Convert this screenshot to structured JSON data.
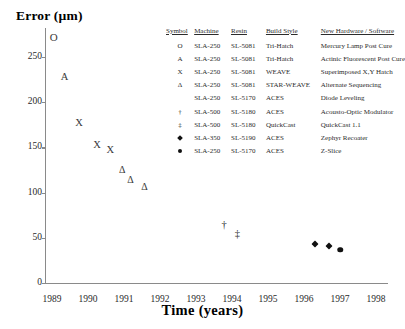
{
  "chart": {
    "type": "scatter",
    "y_axis_title": "Error (µm)",
    "x_axis_title": "Time (years)"
  },
  "chart_data": {
    "type": "scatter",
    "title": "",
    "xlabel": "Time (years)",
    "ylabel": "Error (µm)",
    "xlim": [
      1988.6,
      1998.5
    ],
    "ylim": [
      0,
      280
    ],
    "grid": false,
    "legend_position": "upper-right-inside",
    "y_ticks": [
      0,
      50,
      100,
      150,
      200,
      250
    ],
    "x_ticks": [
      1989,
      1990,
      1991,
      1992,
      1993,
      1994,
      1995,
      1996,
      1997,
      1998
    ],
    "series": [
      {
        "name": "Tri-Hatch / Mercury Lamp Post Cure",
        "marker": "O",
        "points": [
          {
            "x": 1989.05,
            "y": 272
          }
        ]
      },
      {
        "name": "Tri-Hatch / Actinic Fluorescent Post Cure",
        "marker": "A",
        "points": [
          {
            "x": 1989.35,
            "y": 228
          }
        ]
      },
      {
        "name": "WEAVE / Superimposed X,Y Hatch",
        "marker": "X",
        "points": [
          {
            "x": 1989.75,
            "y": 177
          },
          {
            "x": 1990.25,
            "y": 153
          },
          {
            "x": 1990.62,
            "y": 147
          }
        ]
      },
      {
        "name": "STAR-WEAVE / Alternate Sequencing",
        "marker": "Δ",
        "points": [
          {
            "x": 1990.95,
            "y": 125
          },
          {
            "x": 1991.18,
            "y": 114
          },
          {
            "x": 1991.57,
            "y": 106
          }
        ]
      },
      {
        "name": "ACES / Acousto-Optic Modulator",
        "marker": "†",
        "points": [
          {
            "x": 1993.78,
            "y": 64
          }
        ]
      },
      {
        "name": "QuickCast / QuickCast 1.1",
        "marker": "‡",
        "points": [
          {
            "x": 1994.15,
            "y": 54
          }
        ]
      },
      {
        "name": "ACES / Zephyr Recoater",
        "marker": "filled-diamond",
        "points": [
          {
            "x": 1996.3,
            "y": 43
          },
          {
            "x": 1996.7,
            "y": 41
          }
        ]
      },
      {
        "name": "ACES / Z-Slice",
        "marker": "filled-circle",
        "points": [
          {
            "x": 1997.0,
            "y": 37
          }
        ]
      }
    ]
  },
  "legend": {
    "headers": {
      "symbol": "Symbol",
      "machine": "Machine",
      "resin": "Resin",
      "build_style": "Build Style",
      "hardware": "New Hardware / Software"
    },
    "rows": [
      {
        "symbol": "O",
        "symbol_kind": "text",
        "machine": "SLA-250",
        "resin": "SL-5081",
        "build_style": "Tri-Hatch",
        "hardware": "Mercury Lamp Post Cure"
      },
      {
        "symbol": "A",
        "symbol_kind": "text",
        "machine": "SLA-250",
        "resin": "SL-5081",
        "build_style": "Tri-Hatch",
        "hardware": "Actinic Fluorescent Post Cure"
      },
      {
        "symbol": "X",
        "symbol_kind": "text",
        "machine": "SLA-250",
        "resin": "SL-5081",
        "build_style": "WEAVE",
        "hardware": "Superimposed X,Y Hatch"
      },
      {
        "symbol": "Δ",
        "symbol_kind": "text",
        "machine": "SLA-250",
        "resin": "SL-5081",
        "build_style": "STAR-WEAVE",
        "hardware": "Alternate Sequencing"
      },
      {
        "symbol": "",
        "symbol_kind": "text",
        "machine": "SLA-250",
        "resin": "SL-5170",
        "build_style": "ACES",
        "hardware": "Diode Leveling"
      },
      {
        "symbol": "†",
        "symbol_kind": "text",
        "machine": "SLA-500",
        "resin": "SL-5180",
        "build_style": "ACES",
        "hardware": "Acousto-Optic Modulator"
      },
      {
        "symbol": "‡",
        "symbol_kind": "text",
        "machine": "SLA-500",
        "resin": "SL-5180",
        "build_style": "QuickCast",
        "hardware": "QuickCast 1.1"
      },
      {
        "symbol": "",
        "symbol_kind": "filled-diamond",
        "machine": "SLA-350",
        "resin": "SL-5190",
        "build_style": "ACES",
        "hardware": "Zephyr Recoater"
      },
      {
        "symbol": "",
        "symbol_kind": "filled-circle",
        "machine": "SLA-250",
        "resin": "SL-5170",
        "build_style": "ACES",
        "hardware": "Z-Slice"
      }
    ]
  }
}
